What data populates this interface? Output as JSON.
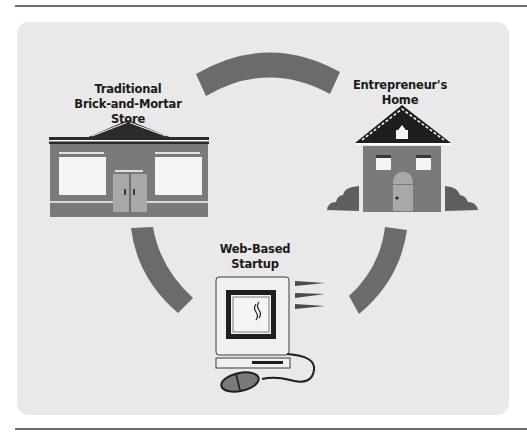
{
  "diagram": {
    "nodes": [
      {
        "id": "store",
        "label_lines": [
          "Traditional",
          "Brick-and-Mortar Store"
        ],
        "icon": "storefront-icon"
      },
      {
        "id": "home",
        "label_lines": [
          "Entrepreneur's",
          "Home"
        ],
        "icon": "house-icon"
      },
      {
        "id": "startup",
        "label_lines": [
          "Web-Based",
          "Startup"
        ],
        "icon": "computer-icon"
      }
    ],
    "connectors": [
      {
        "from": "store",
        "to": "home",
        "shape": "arc",
        "position": "top"
      },
      {
        "from": "store",
        "to": "startup",
        "shape": "arc",
        "position": "left"
      },
      {
        "from": "home",
        "to": "startup",
        "shape": "arc",
        "position": "right"
      }
    ]
  },
  "colors": {
    "panel": "#e9e9e9",
    "arc": "#6b6b6b",
    "building": "#7a7a7a",
    "roof": "#2b2b2b",
    "window": "#f4f4f4",
    "door": "#a8a8a8",
    "rule": "#6e6e6e"
  }
}
